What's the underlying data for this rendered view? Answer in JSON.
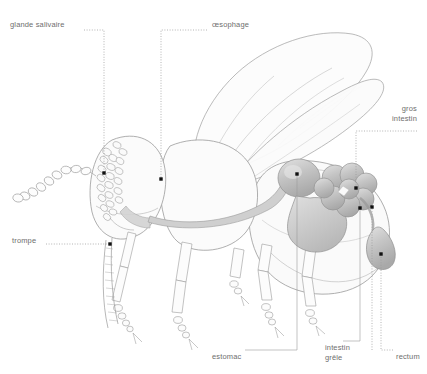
{
  "figure": {
    "system": "appareil digestif",
    "language": "fr",
    "background_color": "#ffffff",
    "line_color": "#8c8c8c",
    "organ_fill": "#c9c9c9",
    "label_color": "#6e6e6e",
    "marker_color": "#111111"
  },
  "labels": [
    {
      "id": "glande-salivaire",
      "text": "glande salivaire",
      "x": 10,
      "y": 20,
      "align": "left",
      "leader": {
        "style": "dotted",
        "path": "M 84 30 L 104 30 L 104 173"
      },
      "marker": {
        "x": 104,
        "y": 173
      }
    },
    {
      "id": "oesophage",
      "text": "œsophage",
      "x": 212,
      "y": 20,
      "align": "left",
      "leader": {
        "style": "dotted",
        "path": "M 207 30 L 161 30 L 161 179"
      },
      "marker": {
        "x": 161,
        "y": 179
      }
    },
    {
      "id": "gros-intestin",
      "text": "gros\nintestin",
      "x": 390,
      "y": 104,
      "align": "right",
      "leader": {
        "style": "dotted",
        "path": "M 417 131 L 356 131 L 356 188"
      },
      "marker": {
        "x": 356,
        "y": 188
      }
    },
    {
      "id": "trompe",
      "text": "trompe",
      "x": 12,
      "y": 236,
      "align": "left",
      "leader": {
        "style": "dotted",
        "path": "M 46 244 L 110 244"
      },
      "marker": {
        "x": 110,
        "y": 244
      }
    },
    {
      "id": "estomac",
      "text": "estomac",
      "x": 212,
      "y": 352,
      "align": "left",
      "leader": {
        "style": "solid",
        "path": "M 245 350 L 297 350 L 297 174"
      },
      "marker": {
        "x": 297,
        "y": 174
      }
    },
    {
      "id": "intestin-grele",
      "text": "intestin\ngrêle",
      "x": 325,
      "y": 343,
      "align": "left",
      "leader": {
        "style": "solid",
        "path": "M 343 341 L 360 341 L 360 208"
      },
      "marker": {
        "x": 360,
        "y": 208
      }
    },
    {
      "id": "rectum",
      "text": "rectum",
      "x": 396,
      "y": 352,
      "align": "left",
      "leader": {
        "style": "dotted",
        "path": "M 393 350 L 381 350 L 381 254"
      },
      "marker": {
        "x": 381,
        "y": 254
      }
    },
    {
      "id": "rectum-upper-link",
      "text": "",
      "x": -999,
      "y": -999,
      "align": "left",
      "leader": {
        "style": "dotted",
        "path": "M 372 350 L 372 207"
      },
      "marker": {
        "x": 372,
        "y": 207
      }
    }
  ]
}
